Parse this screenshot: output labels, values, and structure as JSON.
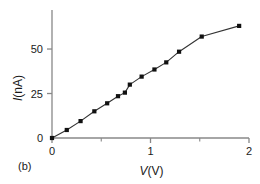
{
  "panel": {
    "label": "(b)"
  },
  "axes": {
    "x": {
      "label_symbol": "V",
      "label_unit": "(V)",
      "ticks": [
        "0",
        "1",
        "2"
      ],
      "minor_ticks": [
        "0.5",
        "1.5"
      ],
      "range": [
        0,
        2
      ]
    },
    "y": {
      "label_symbol": "I",
      "label_unit": "(nA)",
      "ticks": [
        "0",
        "25",
        "50"
      ],
      "range": [
        0,
        68
      ]
    }
  },
  "style": {
    "axis_color": "#888888",
    "line_color": "#333333",
    "marker_color": "#111111",
    "background": "#ffffff"
  },
  "chart_data": {
    "type": "line",
    "title": "",
    "xlabel": "V(V)",
    "ylabel": "I(nA)",
    "xlim": [
      0,
      2
    ],
    "ylim": [
      0,
      68
    ],
    "grid": false,
    "legend": "none",
    "marker": "square",
    "x": [
      0.0,
      0.15,
      0.29,
      0.43,
      0.56,
      0.67,
      0.74,
      0.79,
      0.91,
      1.04,
      1.16,
      1.29,
      1.52,
      1.9
    ],
    "y": [
      0.0,
      4.5,
      9.5,
      15.0,
      19.5,
      23.5,
      25.5,
      30.0,
      34.5,
      38.5,
      42.5,
      48.5,
      57.0,
      63.0
    ],
    "series": [
      {
        "name": "I-V",
        "points": [
          [
            0.0,
            0.0
          ],
          [
            0.15,
            4.5
          ],
          [
            0.29,
            9.5
          ],
          [
            0.43,
            15.0
          ],
          [
            0.56,
            19.5
          ],
          [
            0.67,
            23.5
          ],
          [
            0.74,
            25.5
          ],
          [
            0.79,
            30.0
          ],
          [
            0.91,
            34.5
          ],
          [
            1.04,
            38.5
          ],
          [
            1.16,
            42.5
          ],
          [
            1.29,
            48.5
          ],
          [
            1.52,
            57.0
          ],
          [
            1.9,
            63.0
          ]
        ]
      }
    ]
  }
}
